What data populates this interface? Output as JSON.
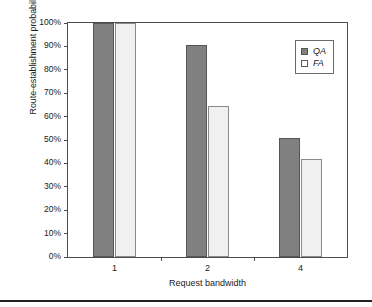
{
  "chart_data": {
    "type": "bar",
    "title": "",
    "subtitle": "",
    "xlabel": "Request bandwidth",
    "ylabel": "Route-establishment probability",
    "categories": [
      "1",
      "2",
      "4"
    ],
    "series": [
      {
        "name": "QA",
        "values": [
          100,
          90.5,
          51
        ]
      },
      {
        "name": "FA",
        "values": [
          100,
          64.5,
          42
        ]
      }
    ],
    "ylim": [
      0,
      100
    ],
    "ytick_values": [
      0,
      10,
      20,
      30,
      40,
      50,
      60,
      70,
      80,
      90,
      100
    ],
    "ytick_labels": [
      "0%",
      "10%",
      "20%",
      "30%",
      "40%",
      "50%",
      "60%",
      "70%",
      "80%",
      "90%",
      "100%"
    ],
    "grid": false,
    "legend_position": "top-right",
    "colors": {
      "series_qa_fill": "#808080",
      "series_qa_edge": "#555555",
      "series_fa_fill": "#f0f0f0",
      "series_fa_edge": "#8a8a8a",
      "axis": "#4d4d4d",
      "text": "#1a1a1a",
      "background": "#ffffff"
    }
  },
  "legend": {
    "entries": [
      {
        "label": "QA",
        "swatch": "filled-gray-square-icon"
      },
      {
        "label": "FA",
        "swatch": "empty-white-square-icon"
      }
    ]
  }
}
